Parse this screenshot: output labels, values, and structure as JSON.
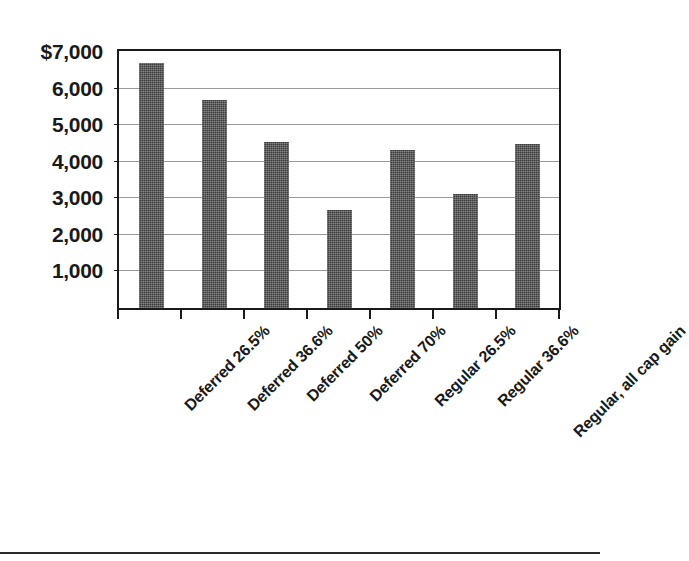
{
  "chart_data": {
    "type": "bar",
    "title": "",
    "subtitle": "",
    "xlabel": "",
    "ylabel": "",
    "categories": [
      "Deferred 26.5%",
      "Deferred 36.6%",
      "Deferred 50%",
      "Deferred 70%",
      "Regular 26.5%",
      "Regular 36.6%",
      "Regular, all cap gain"
    ],
    "values": [
      6700,
      5700,
      4550,
      2680,
      4330,
      3130,
      4490
    ],
    "ylim": [
      0,
      7000
    ],
    "ytick_values": [
      7000,
      6000,
      5000,
      4000,
      3000,
      2000,
      1000
    ],
    "ytick_labels": [
      "$7,000",
      "6,000",
      "5,000",
      "4,000",
      "3,000",
      "2,000",
      "1,000"
    ],
    "gridlines": true,
    "gridline_values": [
      6000,
      5000,
      4000,
      3000,
      2000,
      1000
    ],
    "legend": [],
    "legend_position": "none",
    "series_color": "#3b3b3b",
    "axis_color": "#1a1a1a",
    "grid_color": "#9a9a9a",
    "background_color": "#ffffff",
    "bar_label_rotation_deg": -45
  },
  "figure": {
    "bottom_rule_color": "#2b2b2b"
  }
}
